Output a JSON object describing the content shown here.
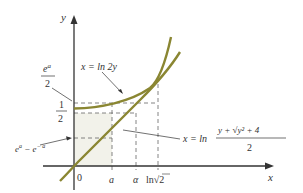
{
  "diagram": {
    "axes": {
      "x_label": "x",
      "y_label": "y",
      "origin_label": "0"
    },
    "x_ticks": [
      {
        "label": "a",
        "x": 112
      },
      {
        "label": "α",
        "x": 136
      },
      {
        "label": "ln√2",
        "x": 158
      }
    ],
    "y_ticks": [
      {
        "label_num": "e",
        "label_sup": "a",
        "label_den": "2",
        "y": 103
      },
      {
        "label_num": "1",
        "label_den": "2",
        "y": 113
      },
      {
        "label": "e^a − e^−a",
        "y": 138
      }
    ],
    "curves": [
      {
        "name": "upper-curve",
        "label": "x = ln 2y",
        "equation": "y = e^x / 2"
      },
      {
        "name": "lower-curve",
        "label_prefix": "x = ln",
        "label_num": "y + √y² + 4",
        "label_den": "2",
        "equation": "y = e^x − e^−x"
      }
    ],
    "labels": {
      "upper_curve": "x = ln 2y",
      "lower_curve_prefix": "x = ln",
      "lower_curve_num": "y + √y² + 4",
      "lower_curve_den": "2",
      "ea2_num": "e",
      "ea2_sup": "a",
      "ea2_den": "2",
      "half_num": "1",
      "half_den": "2",
      "diff_e1": "e",
      "diff_sup1": "a",
      "diff_minus": " − e",
      "diff_sup2": "− a",
      "tick_a": "a",
      "tick_alpha": "α",
      "tick_ln": "ln",
      "tick_sqrt": "√",
      "tick_two": "2"
    },
    "colors": {
      "curve": "#8a8632",
      "axis": "#333333",
      "dash": "#666666",
      "shade": "#f2f2ea"
    }
  }
}
